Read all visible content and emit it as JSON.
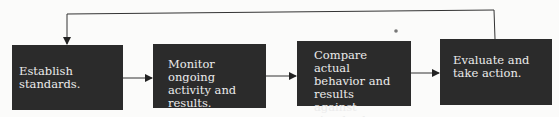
{
  "diagram": {
    "type": "flowchart",
    "steps": [
      {
        "id": "b1",
        "label": "Establish standards."
      },
      {
        "id": "b2",
        "label": "Monitor ongoing activity and results."
      },
      {
        "id": "b3",
        "label": "Compare actual behavior and results against standards."
      },
      {
        "id": "b4",
        "label": "Evaluate and take action."
      }
    ],
    "edges": [
      {
        "from": "b1",
        "to": "b2"
      },
      {
        "from": "b2",
        "to": "b3"
      },
      {
        "from": "b3",
        "to": "b4"
      },
      {
        "from": "b4",
        "to": "b1",
        "kind": "feedback-loop"
      }
    ],
    "colors": {
      "box_fill": "#2b2b2b",
      "box_text": "#ececec",
      "line": "#333333",
      "background": "#fbfbfa"
    }
  }
}
